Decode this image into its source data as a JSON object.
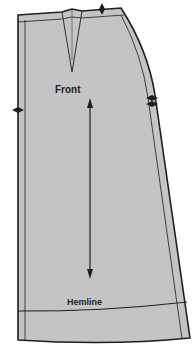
{
  "diagram": {
    "labels": {
      "front": "Front",
      "hemline": "Hemline"
    },
    "colors": {
      "fill": "#c4c4c4",
      "line": "#1e1e1e",
      "background": "#ffffff"
    },
    "elements": [
      "waist-dart",
      "grainline-arrow",
      "hem-fold-line",
      "seam-allowance-lines",
      "notch-waist",
      "notch-left-side",
      "notch-right-side-double"
    ]
  }
}
